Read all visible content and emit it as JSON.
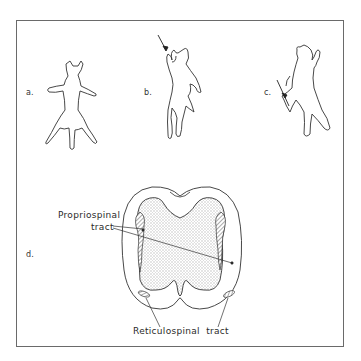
{
  "figure": {
    "panels": [
      {
        "id": "a",
        "label": "a.",
        "description": "cat standing, dorsal view"
      },
      {
        "id": "b",
        "label": "b.",
        "description": "cat rearing, lesion arrow at forelimb level"
      },
      {
        "id": "c",
        "label": "c.",
        "description": "cat rearing, lesion arrow at hindlimb level"
      },
      {
        "id": "d",
        "label": "d.",
        "description": "spinal cord cross-section"
      }
    ],
    "annotations": {
      "propriospinal_line1": "Propriospinal",
      "propriospinal_line2": "tract",
      "reticulospinal": "Reticulospinal  tract"
    },
    "colors": {
      "line": "#333333",
      "frame": "#6a6a6a",
      "gray_matter_fill": "#e4e4e4",
      "background": "#ffffff"
    }
  }
}
